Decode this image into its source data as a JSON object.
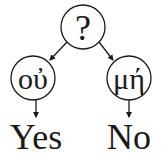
{
  "diagram": {
    "type": "decision-tree",
    "colors": {
      "stroke": "#1a1a1a",
      "background": "#ffffff"
    },
    "root": {
      "label": "?"
    },
    "branches": [
      {
        "node_label": "οὐ",
        "leaf_label": "Yes"
      },
      {
        "node_label": "μή",
        "leaf_label": "No"
      }
    ]
  }
}
